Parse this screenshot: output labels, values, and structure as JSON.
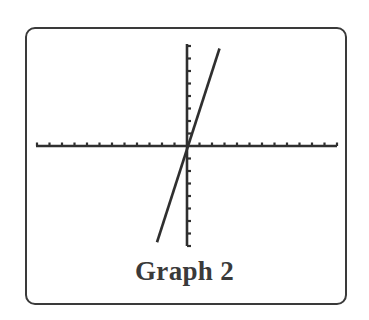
{
  "chart_data": {
    "type": "line",
    "title": "Graph 2",
    "xlabel": "",
    "ylabel": "",
    "xlim": [
      -12,
      12
    ],
    "ylim": [
      -8,
      8
    ],
    "x_ticks": [
      -12,
      -11,
      -10,
      -9,
      -8,
      -7,
      -6,
      -5,
      -4,
      -3,
      -2,
      -1,
      1,
      2,
      3,
      4,
      5,
      6,
      7,
      8,
      9,
      10,
      11,
      12
    ],
    "y_ticks": [
      -8,
      -7,
      -6,
      -5,
      -4,
      -3,
      -2,
      -1,
      1,
      2,
      3,
      4,
      5,
      6,
      7,
      8
    ],
    "tick_labels_shown": false,
    "grid": false,
    "legend": null,
    "series": [
      {
        "name": "line",
        "x": [
          -2.4,
          2.6
        ],
        "y": [
          -7.7,
          7.8
        ],
        "slope_approx": 3.1,
        "y_intercept_approx": 0,
        "passes_through_origin": true
      }
    ],
    "colors": {
      "line": "#2f2f2f",
      "axes": "#2f2f2f",
      "frame": "#3a3a3a",
      "background": "#ffffff"
    }
  },
  "caption": {
    "text": "Graph 2"
  }
}
